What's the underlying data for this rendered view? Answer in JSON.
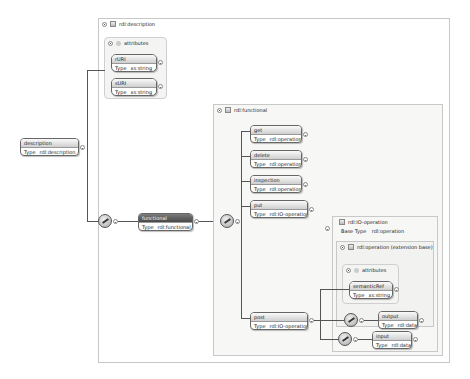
{
  "diagram": {
    "root": {
      "name": "description",
      "type_label": "Type",
      "type": "rdl:description"
    },
    "description_frame": {
      "title": "rdl:description",
      "attributes": {
        "title": "attributes",
        "items": [
          {
            "name": "rURI",
            "type_label": "Type",
            "type": "xs:string"
          },
          {
            "name": "sURI",
            "type_label": "Type",
            "type": "xs:string"
          }
        ]
      }
    },
    "functional_element": {
      "name": "functional",
      "type_label": "Type",
      "type": "rdl:functional"
    },
    "functional_frame": {
      "title": "rdl:functional",
      "children": [
        {
          "name": "get",
          "type_label": "Type",
          "type": "rdl:operation"
        },
        {
          "name": "delete",
          "type_label": "Type",
          "type": "rdl:operation"
        },
        {
          "name": "inspection",
          "type_label": "Type",
          "type": "rdl:operation"
        },
        {
          "name": "put",
          "type_label": "Type",
          "type": "rdl:IO-operation"
        },
        {
          "name": "post",
          "type_label": "Type",
          "type": "rdl:IO-operation"
        }
      ]
    },
    "io_operation_frame": {
      "title": "rdl:IO-operation",
      "base_type_label": "Base Type",
      "base_type": "rdl:operation",
      "extension": {
        "title": "rdl:operation (extension base)",
        "attributes": {
          "title": "attributes",
          "items": [
            {
              "name": "semanticRef",
              "type_label": "Type",
              "type": "xs:string"
            }
          ]
        },
        "output": {
          "name": "output",
          "type_label": "Type",
          "type": "rdl:data"
        }
      },
      "input": {
        "name": "input",
        "type_label": "Type",
        "type": "rdl:data"
      }
    }
  }
}
